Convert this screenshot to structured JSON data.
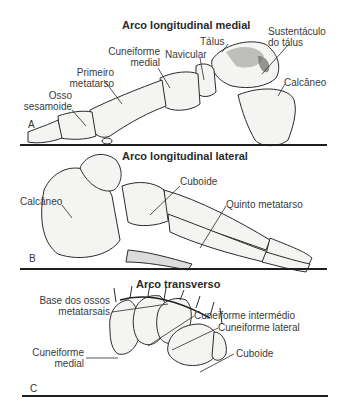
{
  "panels": [
    {
      "letter": "A",
      "title": "Arco longitudinal medial",
      "labels": {
        "talus": "Tálus",
        "sustentaculum": [
          "Sustentáculo",
          "do tálus"
        ],
        "cuneiform_medial": [
          "Cuneiforme",
          "medial"
        ],
        "navicular": "Navicular",
        "first_metatarsal": [
          "Primeiro",
          "metatarso"
        ],
        "calcaneus": "Calcâneo",
        "sesamoid": [
          "Osso",
          "sesamoide"
        ]
      }
    },
    {
      "letter": "B",
      "title": "Arco longitudinal lateral",
      "labels": {
        "cuboid": "Cuboide",
        "calcaneus": "Calcâneo",
        "fifth_metatarsal": "Quinto metatarso"
      }
    },
    {
      "letter": "C",
      "title": "Arco transverso",
      "labels": {
        "metatarsal_bases": [
          "Base dos ossos",
          "metatarsais"
        ],
        "cuneiform_intermediate": "Cuneiforme intermédio",
        "cuneiform_lateral": "Cuneiforme lateral",
        "cuneiform_medial": [
          "Cuneiforme",
          "medial"
        ],
        "cuboid": "Cuboide"
      }
    }
  ],
  "colors": {
    "bone_fill": "#f4f4f2",
    "bone_stroke": "#2b2b2b",
    "shade": "#9a9a9a",
    "ground": "#1e1e1e"
  }
}
